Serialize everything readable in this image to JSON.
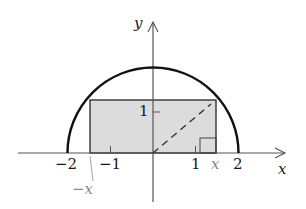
{
  "diagram": {
    "axes": {
      "x_label": "x",
      "y_label": "y"
    },
    "ticks": {
      "x": [
        "−2",
        "−1",
        "1",
        "2"
      ],
      "y": [
        "1"
      ]
    },
    "annotations": {
      "pos_x": "x",
      "neg_x": "−x"
    },
    "colors": {
      "curve": "#111111",
      "rectangle_fill": "#dcdcdc",
      "rectangle_stroke": "#333333",
      "axes": "#555555",
      "annotation": "#8a8a8a"
    }
  }
}
